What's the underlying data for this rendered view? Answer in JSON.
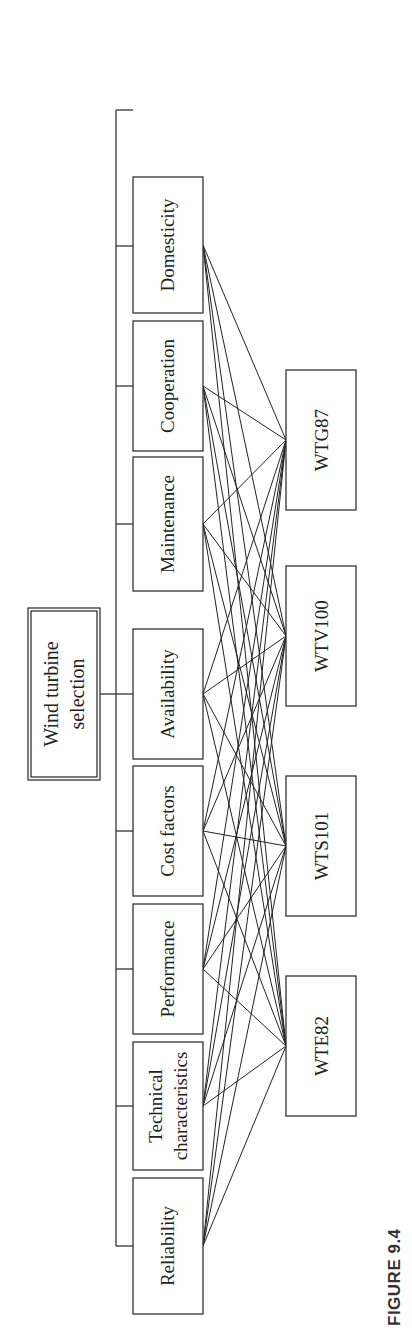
{
  "figure": {
    "caption": "FIGURE 9.4",
    "goal": {
      "label_line1": "Wind turbine",
      "label_line2": "selection"
    },
    "criteria": [
      {
        "id": "reliability",
        "label_line1": "Reliability",
        "label_line2": ""
      },
      {
        "id": "technical",
        "label_line1": "Technical",
        "label_line2": "characteristics"
      },
      {
        "id": "performance",
        "label_line1": "Performance",
        "label_line2": ""
      },
      {
        "id": "cost",
        "label_line1": "Cost factors",
        "label_line2": ""
      },
      {
        "id": "availability",
        "label_line1": "Availability",
        "label_line2": ""
      },
      {
        "id": "maintenance",
        "label_line1": "Maintenance",
        "label_line2": ""
      },
      {
        "id": "cooperation",
        "label_line1": "Cooperation",
        "label_line2": ""
      },
      {
        "id": "domesticity",
        "label_line1": "Domesticity",
        "label_line2": ""
      }
    ],
    "alternatives": [
      {
        "id": "wte82",
        "label": "WTE82"
      },
      {
        "id": "wts101",
        "label": "WTS101"
      },
      {
        "id": "wtv100",
        "label": "WTV100"
      },
      {
        "id": "wtg87",
        "label": "WTG87"
      }
    ],
    "connections": "every criterion connected to every alternative"
  }
}
